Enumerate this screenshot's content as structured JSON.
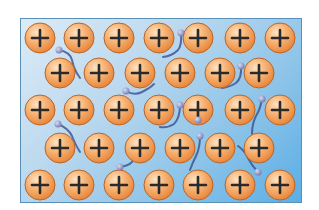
{
  "diagram": {
    "title": "",
    "colors": {
      "background_light": "#dcebf6",
      "background_dark": "#5aaee6",
      "border": "#5a8fb8",
      "ion_fill": "#f5a35a",
      "ion_highlight": "#fde3c4",
      "ion_stroke": "#b8662a",
      "plus_sign": "#2a2a2a",
      "electron": "#8a8fc0",
      "trail": "#3a4f8f"
    },
    "ion_symbol": "+",
    "ion_radius": 15,
    "ions": [
      {
        "x": 40,
        "y": 38
      },
      {
        "x": 79,
        "y": 38
      },
      {
        "x": 119,
        "y": 38
      },
      {
        "x": 159,
        "y": 38
      },
      {
        "x": 198,
        "y": 38
      },
      {
        "x": 240,
        "y": 38
      },
      {
        "x": 280,
        "y": 38
      },
      {
        "x": 60,
        "y": 73
      },
      {
        "x": 99,
        "y": 73
      },
      {
        "x": 140,
        "y": 73
      },
      {
        "x": 180,
        "y": 73
      },
      {
        "x": 220,
        "y": 73
      },
      {
        "x": 259,
        "y": 73
      },
      {
        "x": 40,
        "y": 110
      },
      {
        "x": 79,
        "y": 110
      },
      {
        "x": 119,
        "y": 110
      },
      {
        "x": 159,
        "y": 110
      },
      {
        "x": 198,
        "y": 110
      },
      {
        "x": 240,
        "y": 110
      },
      {
        "x": 280,
        "y": 110
      },
      {
        "x": 60,
        "y": 148
      },
      {
        "x": 99,
        "y": 148
      },
      {
        "x": 140,
        "y": 148
      },
      {
        "x": 180,
        "y": 148
      },
      {
        "x": 220,
        "y": 148
      },
      {
        "x": 259,
        "y": 148
      },
      {
        "x": 40,
        "y": 185
      },
      {
        "x": 79,
        "y": 185
      },
      {
        "x": 119,
        "y": 185
      },
      {
        "x": 159,
        "y": 185
      },
      {
        "x": 198,
        "y": 185
      },
      {
        "x": 240,
        "y": 185
      },
      {
        "x": 280,
        "y": 185
      }
    ],
    "electrons": [
      {
        "x": 59,
        "y": 50,
        "trail": "M59,50 Q70,52 72,60 Q74,70 80,78"
      },
      {
        "x": 181,
        "y": 33,
        "trail": "M181,33 Q182,45 178,50 Q172,56 163,57"
      },
      {
        "x": 126,
        "y": 91,
        "trail": "M126,91 Q134,96 142,92 Q150,88 154,84"
      },
      {
        "x": 241,
        "y": 66,
        "trail": "M241,66 Q242,78 236,83 Q230,87 222,88"
      },
      {
        "x": 180,
        "y": 105,
        "trail": "M180,105 Q180,118 174,124 Q168,128 160,127"
      },
      {
        "x": 262,
        "y": 99,
        "trail": "M262,99 Q260,110 256,116 Q252,124 252,134"
      },
      {
        "x": 58,
        "y": 124,
        "trail": "M58,124 Q68,128 72,136 Q76,146 80,152"
      },
      {
        "x": 200,
        "y": 136,
        "trail": "M200,136 Q200,148 196,156 Q192,164 190,170"
      },
      {
        "x": 120,
        "y": 167,
        "trail": "M120,167 Q128,166 132,162 Q136,156 136,150"
      },
      {
        "x": 258,
        "y": 172,
        "trail": "M258,172 Q252,166 248,158 Q244,150 238,146"
      },
      {
        "x": 198,
        "y": 120,
        "trail": ""
      }
    ]
  }
}
